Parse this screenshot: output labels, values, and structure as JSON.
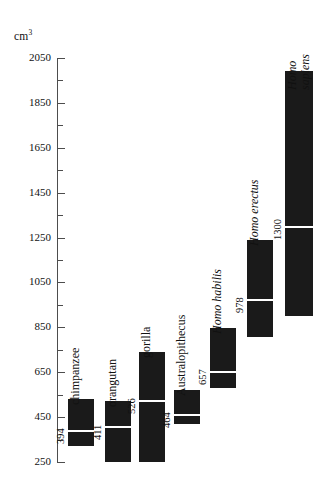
{
  "chart_data": {
    "type": "bar",
    "title": "",
    "subtitle": "",
    "xlabel": "",
    "ylabel": "cm3",
    "ylabel_display": "cm",
    "ylabel_superscript": "3",
    "ylim": [
      250,
      2050
    ],
    "ytick_step": 200,
    "yminor_step": 100,
    "grid": false,
    "legend": "none",
    "orientation": "vertical",
    "bar_color": "#1a1a1a",
    "mean_marker_color": "#ffffff",
    "axis_color": "#4d4d4d",
    "background_color": "#ffffff",
    "note": "Each black bar spans the cranial-capacity range; the white line marks the mean, labelled beside the bar.",
    "yticks": [
      {
        "value": 2050,
        "label": "2050"
      },
      {
        "value": 1850,
        "label": "1850"
      },
      {
        "value": 1650,
        "label": "1650"
      },
      {
        "value": 1450,
        "label": "1450"
      },
      {
        "value": 1250,
        "label": "1250"
      },
      {
        "value": 1050,
        "label": "1050"
      },
      {
        "value": 850,
        "label": "850"
      },
      {
        "value": 650,
        "label": "650"
      },
      {
        "value": 450,
        "label": "450"
      },
      {
        "value": 250,
        "label": "250"
      }
    ],
    "yminor_ticks": [
      1950,
      1750,
      1550,
      1350,
      1150,
      950,
      750,
      550,
      350
    ],
    "categories": [
      "chimpanzee",
      "orangutan",
      "gorilla",
      "Australopithecus",
      "Homo habilis",
      "Homo erectus",
      "Homo sapiens"
    ],
    "values": [
      394,
      411,
      526,
      464,
      657,
      978,
      1300
    ],
    "series": [
      {
        "name": "mean cranial capacity",
        "values": [
          394,
          411,
          526,
          464,
          657,
          978,
          1300
        ]
      },
      {
        "name": "range low",
        "values": [
          320,
          250,
          250,
          320,
          500,
          280,
          900
        ]
      },
      {
        "name": "range high",
        "values": [
          530,
          520,
          740,
          570,
          840,
          1240,
          1990
        ]
      }
    ],
    "bars": [
      {
        "category": "chimpanzee",
        "label": "chimpanzee",
        "italic": false,
        "two_line": false,
        "mean": 394,
        "mean_label": "394",
        "range_low": 320,
        "range_high": 530
      },
      {
        "category": "orangutan",
        "label": "orangutan",
        "italic": false,
        "two_line": false,
        "mean": 411,
        "mean_label": "411",
        "range_low": 250,
        "range_high": 520
      },
      {
        "category": "gorilla",
        "label": "gorilla",
        "italic": false,
        "two_line": false,
        "mean": 526,
        "mean_label": "526",
        "range_low": 250,
        "range_high": 740
      },
      {
        "category": "Australopithecus",
        "label": "Australopithecus",
        "italic": false,
        "two_line": false,
        "mean": 464,
        "mean_label": "464",
        "range_low": 420,
        "range_high": 570
      },
      {
        "category": "Homo habilis",
        "label": "Homo habilis",
        "italic": true,
        "two_line": false,
        "mean": 657,
        "mean_label": "657",
        "range_low": 580,
        "range_high": 845
      },
      {
        "category": "Homo erectus",
        "label": "Homo erectus",
        "italic": true,
        "two_line": false,
        "mean": 978,
        "mean_label": "978",
        "range_low": 805,
        "range_high": 1240
      },
      {
        "category": "Homo sapiens",
        "label": "Homo sapiens",
        "label_line1": "Homo",
        "label_line2": "sapiens",
        "italic": true,
        "two_line": true,
        "mean": 1300,
        "mean_label": "1300",
        "range_low": 900,
        "range_high": 1990
      }
    ]
  }
}
